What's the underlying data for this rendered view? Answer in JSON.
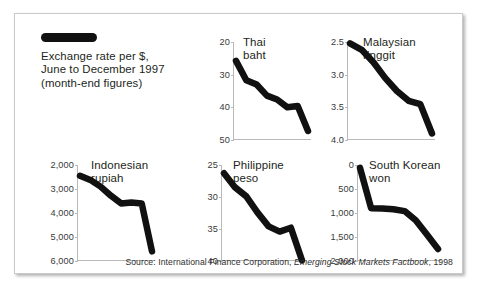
{
  "legend": {
    "swatch_name": "line-swatch",
    "caption": "Exchange rate per $,\nJune to December 1997\n(month-end figures)"
  },
  "source": {
    "prefix": "Source: International Finance Corporation, ",
    "italic": "Emerging Stock Markets Factbook",
    "suffix": ", 1998"
  },
  "chart_data": [
    {
      "type": "line",
      "title": "Thai\nbaht",
      "id": "thai-baht",
      "xlabel": "",
      "ylabel": "",
      "ylim": [
        20,
        50
      ],
      "y_inverted": true,
      "ticks": [
        20,
        30,
        40,
        50
      ],
      "tick_labels": [
        "20",
        "30",
        "40",
        "50"
      ],
      "x": [
        "Jun",
        "Jul",
        "Aug",
        "Sep",
        "Oct",
        "Nov",
        "Dec"
      ],
      "values": [
        25.8,
        31.7,
        33.0,
        36.4,
        37.6,
        40.0,
        39.6,
        47.2
      ],
      "grid": false,
      "legend": "none"
    },
    {
      "type": "line",
      "title": "Malaysian\nringgit",
      "id": "malaysian-ringgit",
      "xlabel": "",
      "ylabel": "",
      "ylim": [
        2.5,
        4.0
      ],
      "y_inverted": true,
      "ticks": [
        2.5,
        3.0,
        3.5,
        4.0
      ],
      "tick_labels": [
        "2.5",
        "3.0",
        "3.5",
        "4.0"
      ],
      "x": [
        "Jun",
        "Jul",
        "Aug",
        "Sep",
        "Oct",
        "Nov",
        "Dec"
      ],
      "values": [
        2.52,
        2.62,
        2.81,
        3.05,
        3.25,
        3.4,
        3.45,
        3.9
      ],
      "grid": false,
      "legend": "none"
    },
    {
      "type": "line",
      "title": "Indonesian\nrupiah",
      "id": "indonesian-rupiah",
      "xlabel": "",
      "ylabel": "",
      "ylim": [
        2000,
        6000
      ],
      "y_inverted": true,
      "ticks": [
        2000,
        3000,
        4000,
        5000,
        6000
      ],
      "tick_labels": [
        "2,000",
        "3,000",
        "4,000",
        "5,000",
        "6,000"
      ],
      "x": [
        "Jun",
        "Jul",
        "Aug",
        "Sep",
        "Oct",
        "Nov",
        "Dec"
      ],
      "values": [
        2450,
        2620,
        2900,
        3280,
        3600,
        3560,
        3600,
        5600
      ],
      "grid": false,
      "legend": "none"
    },
    {
      "type": "line",
      "title": "Philippine\npeso",
      "id": "philippine-peso",
      "xlabel": "",
      "ylabel": "",
      "ylim": [
        25,
        40
      ],
      "y_inverted": true,
      "ticks": [
        25,
        30,
        35,
        40
      ],
      "tick_labels": [
        "25",
        "30",
        "35",
        "40"
      ],
      "x": [
        "Jun",
        "Jul",
        "Aug",
        "Sep",
        "Oct",
        "Nov",
        "Dec"
      ],
      "values": [
        26.3,
        28.5,
        29.9,
        32.4,
        34.6,
        35.4,
        34.8,
        39.9
      ],
      "grid": false,
      "legend": "none"
    },
    {
      "type": "line",
      "title": "South Korean\nwon",
      "id": "south-korean-won",
      "xlabel": "",
      "ylabel": "",
      "ylim": [
        0,
        2000
      ],
      "y_inverted": true,
      "ticks": [
        0,
        500,
        1000,
        1500,
        2000
      ],
      "tick_labels": [
        "0",
        "500",
        "1,000",
        "1,500",
        "2,000"
      ],
      "x": [
        "Jun",
        "Jul",
        "Aug",
        "Sep",
        "Oct",
        "Nov",
        "Dec"
      ],
      "values": [
        60,
        900,
        905,
        920,
        960,
        1150,
        1450,
        1750
      ],
      "grid": false,
      "legend": "none"
    }
  ]
}
